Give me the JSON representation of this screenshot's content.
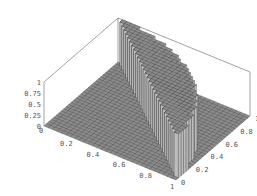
{
  "chart_data": {
    "type": "surface3d",
    "title": "",
    "function": "z = 1 if (x + y > 1 and x^2 + y^2 < 1) else 0",
    "grid_resolution": 30,
    "xlim": [
      0,
      1
    ],
    "ylim": [
      0,
      1
    ],
    "zlim": [
      0,
      1
    ],
    "x_ticks": [
      "0",
      "0.2",
      "0.4",
      "0.6",
      "0.8",
      "1"
    ],
    "y_ticks": [
      "0",
      "0.2",
      "0.4",
      "0.6",
      "0.8",
      "1"
    ],
    "z_ticks": [
      "0",
      "0.25",
      "0.5",
      "0.75",
      "1"
    ],
    "x_tick_values": [
      0,
      0.2,
      0.4,
      0.6,
      0.8,
      1
    ],
    "y_tick_values": [
      0,
      0.2,
      0.4,
      0.6,
      0.8,
      1
    ],
    "z_tick_values": [
      0,
      0.25,
      0.5,
      0.75,
      1
    ],
    "boxed": true,
    "colors": {
      "surface_face": "#8c8c8c",
      "surface_edge": "#3a3a3a",
      "wall_dark": "#2a2a2a",
      "wall_light": "#bdbdbd",
      "box_line": "#8a8a8a",
      "tick_text": "#555555"
    }
  }
}
